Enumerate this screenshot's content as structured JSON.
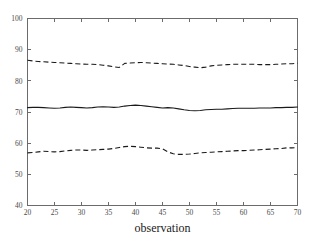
{
  "chart_data": {
    "type": "line",
    "title": "",
    "xlabel": "observation",
    "ylabel": "",
    "xlim": [
      20,
      70
    ],
    "ylim": [
      40,
      100
    ],
    "grid": false,
    "legend": "none",
    "xticks": [
      20,
      25,
      30,
      35,
      40,
      45,
      50,
      55,
      60,
      65,
      70
    ],
    "yticks": [
      40,
      50,
      60,
      70,
      80,
      90,
      100
    ],
    "xticklabels": [
      "20",
      "25",
      "30",
      "35",
      "40",
      "45",
      "50",
      "55",
      "60",
      "65",
      "70"
    ],
    "yticklabels": [
      "40",
      "50",
      "60",
      "70",
      "80",
      "90",
      "100"
    ],
    "x": [
      20,
      21,
      22,
      23,
      24,
      25,
      26,
      27,
      28,
      29,
      30,
      31,
      32,
      33,
      34,
      35,
      36,
      37,
      38,
      39,
      40,
      41,
      42,
      43,
      44,
      45,
      46,
      47,
      48,
      49,
      50,
      51,
      52,
      53,
      54,
      55,
      56,
      57,
      58,
      59,
      60,
      61,
      62,
      63,
      64,
      65,
      66,
      67,
      68,
      69,
      70
    ],
    "series": [
      {
        "name": "upper band",
        "style": "dashed",
        "color": "#1a1a1a",
        "values": [
          86.6,
          86.4,
          86.2,
          86.1,
          86.0,
          85.9,
          85.8,
          85.7,
          85.6,
          85.5,
          85.4,
          85.3,
          85.3,
          85.2,
          85.0,
          84.8,
          84.5,
          84.3,
          85.6,
          85.7,
          85.8,
          85.9,
          85.8,
          85.7,
          85.6,
          85.5,
          85.4,
          85.3,
          85.1,
          84.9,
          84.6,
          84.4,
          84.2,
          84.4,
          84.8,
          85.0,
          85.1,
          85.2,
          85.3,
          85.3,
          85.3,
          85.3,
          85.3,
          85.2,
          85.2,
          85.2,
          85.3,
          85.4,
          85.5,
          85.5,
          85.6
        ]
      },
      {
        "name": "center line",
        "style": "solid",
        "color": "#1a1a1a",
        "values": [
          71.4,
          71.5,
          71.5,
          71.4,
          71.3,
          71.2,
          71.3,
          71.5,
          71.6,
          71.5,
          71.4,
          71.3,
          71.4,
          71.6,
          71.7,
          71.6,
          71.5,
          71.6,
          71.9,
          72.1,
          72.2,
          72.1,
          71.9,
          71.7,
          71.5,
          71.3,
          71.4,
          71.3,
          71.0,
          70.7,
          70.5,
          70.4,
          70.5,
          70.7,
          70.8,
          70.9,
          70.9,
          71.0,
          71.1,
          71.2,
          71.2,
          71.2,
          71.2,
          71.3,
          71.3,
          71.3,
          71.4,
          71.4,
          71.5,
          71.5,
          71.6
        ]
      },
      {
        "name": "lower band",
        "style": "dashed",
        "color": "#1a1a1a",
        "values": [
          56.9,
          57.0,
          57.2,
          57.4,
          57.3,
          57.2,
          57.3,
          57.5,
          57.7,
          57.8,
          57.8,
          57.7,
          57.8,
          57.9,
          58.0,
          58.1,
          58.3,
          58.6,
          58.9,
          59.0,
          58.9,
          58.7,
          58.5,
          58.4,
          58.4,
          58.2,
          57.2,
          56.6,
          56.4,
          56.4,
          56.5,
          56.7,
          56.9,
          57.0,
          57.1,
          57.2,
          57.3,
          57.4,
          57.5,
          57.6,
          57.6,
          57.7,
          57.8,
          57.9,
          58.0,
          58.1,
          58.2,
          58.3,
          58.5,
          58.5,
          58.6
        ]
      }
    ]
  }
}
